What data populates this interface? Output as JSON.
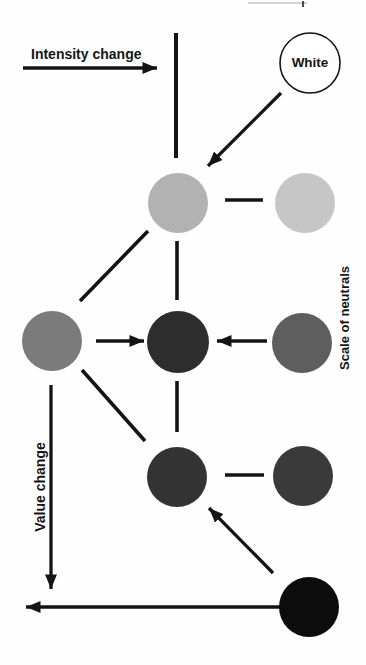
{
  "page": {
    "width": 366,
    "height": 665,
    "background": "#fefefe"
  },
  "labels": {
    "intensity": "Intensity change",
    "white": "White",
    "value": "Value change",
    "scale": "Scale of neutrals"
  },
  "colors": {
    "ink": "#141414",
    "background": "#fefefe",
    "artifact_gray": "#a8a8a8",
    "artifact_dark": "#4a4a4a"
  },
  "diagram": {
    "circles": [
      {
        "name": "white-circle",
        "cx": 310,
        "cy": 63,
        "r": 30,
        "fill": "#ffffff",
        "stroke": "#141414"
      },
      {
        "name": "neutral-light-circle",
        "cx": 178,
        "cy": 203,
        "r": 30,
        "fill": "#b2b2b2"
      },
      {
        "name": "neutral-lighter-circle",
        "cx": 305,
        "cy": 203,
        "r": 30,
        "fill": "#c6c6c6"
      },
      {
        "name": "neutral-mid-gray-circle",
        "cx": 52,
        "cy": 341,
        "r": 30,
        "fill": "#7b7b7b"
      },
      {
        "name": "neutral-dark-center-circle",
        "cx": 178,
        "cy": 342,
        "r": 31,
        "fill": "#2d2d2d"
      },
      {
        "name": "neutral-dark-right-circle",
        "cx": 302,
        "cy": 343,
        "r": 30,
        "fill": "#5e5e5e"
      },
      {
        "name": "neutral-darker-center-circle",
        "cx": 177,
        "cy": 477,
        "r": 30,
        "fill": "#333333"
      },
      {
        "name": "neutral-darker-right-circle",
        "cx": 303,
        "cy": 476,
        "r": 30,
        "fill": "#3a3a3a"
      },
      {
        "name": "black-circle",
        "cx": 309,
        "cy": 607,
        "r": 30,
        "fill": "#0c0c0c"
      }
    ],
    "lines": [
      {
        "name": "top-vertical-line",
        "x1": 176,
        "y1": 33,
        "x2": 176,
        "y2": 158,
        "width": 4
      },
      {
        "name": "top-connector-line",
        "x1": 225,
        "y1": 200,
        "x2": 263,
        "y2": 200,
        "width": 3.4
      },
      {
        "name": "diagonal-up-line",
        "x1": 80,
        "y1": 301,
        "x2": 148,
        "y2": 231,
        "width": 3.6
      },
      {
        "name": "center-vertical-upper-line",
        "x1": 177,
        "y1": 241,
        "x2": 177,
        "y2": 300,
        "width": 3.6
      },
      {
        "name": "center-vertical-lower-line",
        "x1": 177,
        "y1": 381,
        "x2": 177,
        "y2": 432,
        "width": 3.6
      },
      {
        "name": "diagonal-down-line",
        "x1": 82,
        "y1": 370,
        "x2": 145,
        "y2": 441,
        "width": 3.6
      },
      {
        "name": "lower-connector-line",
        "x1": 225,
        "y1": 475,
        "x2": 264,
        "y2": 475,
        "width": 3.4
      },
      {
        "name": "page-edge-artifact-line",
        "x1": 248,
        "y1": 3,
        "x2": 307,
        "y2": 3,
        "width": 1.2,
        "color": "#a8a8a8"
      },
      {
        "name": "page-edge-artifact-tick",
        "x1": 303,
        "y1": 1,
        "x2": 303,
        "y2": 7,
        "width": 2,
        "color": "#4a4a4a"
      }
    ],
    "arrows": [
      {
        "name": "intensity-change-arrow",
        "x1": 23,
        "y1": 68,
        "x2": 157,
        "y2": 68,
        "width": 3.3
      },
      {
        "name": "white-to-gray-arrow",
        "x1": 281,
        "y1": 93,
        "x2": 208,
        "y2": 166,
        "width": 3.3
      },
      {
        "name": "left-to-center-arrow",
        "x1": 96,
        "y1": 341,
        "x2": 144,
        "y2": 341,
        "width": 3.3
      },
      {
        "name": "right-to-center-arrow",
        "x1": 267,
        "y1": 341,
        "x2": 217,
        "y2": 341,
        "width": 3.3
      },
      {
        "name": "value-change-arrow",
        "x1": 51,
        "y1": 385,
        "x2": 51,
        "y2": 589,
        "width": 3.3
      },
      {
        "name": "black-to-dark-arrow",
        "x1": 273,
        "y1": 573,
        "x2": 209,
        "y2": 508,
        "width": 3.3
      },
      {
        "name": "bottom-left-arrow",
        "x1": 280,
        "y1": 607,
        "x2": 26,
        "y2": 607,
        "width": 3.3
      }
    ]
  }
}
